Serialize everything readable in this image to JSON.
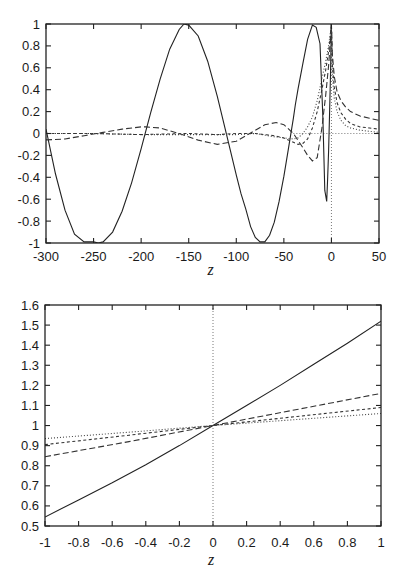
{
  "chart_data": [
    {
      "type": "line",
      "title": "",
      "xlabel": "z",
      "ylabel": "",
      "xlim": [
        -300,
        50
      ],
      "ylim": [
        -1,
        1
      ],
      "grid": false,
      "legend": "none",
      "x_ticks": [
        -300,
        -250,
        -200,
        -150,
        -100,
        -50,
        0,
        50
      ],
      "x_tick_labels": [
        "-300",
        "-250",
        "-200",
        "-150",
        "-100",
        "-50",
        "0",
        "50"
      ],
      "y_ticks": [
        -1,
        -0.8,
        -0.6,
        -0.4,
        -0.2,
        0,
        0.2,
        0.4,
        0.6,
        0.8,
        1
      ],
      "y_tick_labels": [
        "-1",
        "-0.8",
        "-0.6",
        "-0.4",
        "-0.2",
        "0",
        "0.2",
        "0.4",
        "0.6",
        "0.8",
        "1"
      ],
      "reference_lines": [
        {
          "orientation": "vertical",
          "at": 0,
          "style": "dotted"
        },
        {
          "orientation": "horizontal",
          "at": 0,
          "style": "dotted",
          "from": -40,
          "to": 50
        }
      ],
      "series": [
        {
          "name": "solid",
          "style": "solid",
          "x": [
            -300,
            -290,
            -280,
            -270,
            -260,
            -250,
            -245,
            -240,
            -230,
            -220,
            -210,
            -200,
            -190,
            -180,
            -170,
            -160,
            -155,
            -150,
            -140,
            -130,
            -120,
            -110,
            -100,
            -95,
            -90,
            -85,
            -80,
            -75,
            -70,
            -65,
            -60,
            -55,
            -50,
            -45,
            -40,
            -38,
            -35,
            -30,
            -25,
            -20,
            -16,
            -12,
            -9,
            -7,
            -5,
            -4,
            -3,
            -2,
            -1,
            0,
            0.5
          ],
          "y": [
            0.04,
            -0.37,
            -0.7,
            -0.92,
            -0.99,
            -0.99,
            -1.0,
            -0.99,
            -0.9,
            -0.71,
            -0.45,
            -0.14,
            0.19,
            0.5,
            0.77,
            0.95,
            1.0,
            0.99,
            0.89,
            0.66,
            0.34,
            -0.02,
            -0.38,
            -0.55,
            -0.69,
            -0.85,
            -0.95,
            -0.99,
            -0.99,
            -0.93,
            -0.81,
            -0.62,
            -0.39,
            -0.13,
            0.14,
            0.26,
            0.41,
            0.64,
            0.86,
            0.99,
            0.97,
            0.82,
            0.14,
            -0.52,
            -0.62,
            -0.42,
            -0.16,
            0.16,
            0.54,
            1.0,
            1.25
          ]
        },
        {
          "name": "long-dashed",
          "style": "long-dash",
          "x": [
            -300,
            -280,
            -260,
            -240,
            -220,
            -200,
            -195,
            -180,
            -160,
            -140,
            -120,
            -100,
            -80,
            -70,
            -58,
            -50,
            -40,
            -30,
            -25,
            -20,
            -15,
            -10,
            -6,
            -3,
            -1,
            0,
            1,
            3,
            6,
            10,
            15,
            20,
            30,
            40,
            50
          ],
          "y": [
            -0.058,
            -0.05,
            -0.02,
            0.01,
            0.04,
            0.06,
            0.06,
            0.05,
            0.0,
            -0.06,
            -0.1,
            -0.07,
            0.03,
            0.08,
            0.1,
            0.08,
            0.0,
            -0.13,
            -0.2,
            -0.25,
            -0.22,
            0.05,
            0.35,
            0.62,
            0.85,
            1.0,
            0.72,
            0.52,
            0.38,
            0.3,
            0.24,
            0.2,
            0.16,
            0.14,
            0.12
          ]
        },
        {
          "name": "short-dashed",
          "style": "short-dash",
          "x": [
            -300,
            -250,
            -200,
            -150,
            -120,
            -100,
            -80,
            -60,
            -50,
            -40,
            -35,
            -30,
            -25,
            -20,
            -15,
            -10,
            -6,
            -3,
            -1,
            0,
            1,
            3,
            6,
            10,
            15,
            20,
            30,
            40,
            50
          ],
          "y": [
            0.0,
            0.0,
            -0.01,
            0.0,
            -0.01,
            0.0,
            0.0,
            -0.02,
            -0.04,
            -0.08,
            -0.1,
            -0.09,
            -0.05,
            0.05,
            0.2,
            0.4,
            0.58,
            0.75,
            0.9,
            1.0,
            0.62,
            0.42,
            0.28,
            0.19,
            0.13,
            0.09,
            0.06,
            0.05,
            0.04
          ]
        },
        {
          "name": "dotted",
          "style": "dotted",
          "x": [
            -300,
            -250,
            -200,
            -150,
            -100,
            -80,
            -60,
            -50,
            -40,
            -35,
            -30,
            -25,
            -20,
            -15,
            -10,
            -6,
            -3,
            -1,
            0,
            1,
            3,
            6,
            10,
            15,
            20,
            30,
            40,
            50
          ],
          "y": [
            0.0,
            0.0,
            -0.01,
            -0.01,
            -0.01,
            0.0,
            -0.03,
            -0.04,
            -0.05,
            -0.04,
            0.0,
            0.06,
            0.15,
            0.3,
            0.5,
            0.66,
            0.8,
            0.93,
            1.0,
            0.52,
            0.32,
            0.2,
            0.12,
            0.07,
            0.05,
            0.03,
            0.02,
            0.01
          ]
        }
      ]
    },
    {
      "type": "line",
      "title": "",
      "xlabel": "z",
      "ylabel": "",
      "xlim": [
        -1,
        1
      ],
      "ylim": [
        0.5,
        1.6
      ],
      "grid": false,
      "legend": "none",
      "x_ticks": [
        -1,
        -0.8,
        -0.6,
        -0.4,
        -0.2,
        0,
        0.2,
        0.4,
        0.6,
        0.8,
        1
      ],
      "x_tick_labels": [
        "-1",
        "-0.8",
        "-0.6",
        "-0.4",
        "-0.2",
        "0",
        "0.2",
        "0.4",
        "0.6",
        "0.8",
        "1"
      ],
      "y_ticks": [
        0.5,
        0.6,
        0.7,
        0.8,
        0.9,
        1,
        1.1,
        1.2,
        1.3,
        1.4,
        1.5,
        1.6
      ],
      "y_tick_labels": [
        "0.5",
        "0.6",
        "0.7",
        "0.8",
        "0.9",
        "1",
        "1.1",
        "1.2",
        "1.3",
        "1.4",
        "1.5",
        "1.6"
      ],
      "reference_lines": [
        {
          "orientation": "vertical",
          "at": 0,
          "style": "dotted"
        }
      ],
      "series": [
        {
          "name": "solid",
          "style": "solid",
          "x": [
            -1,
            -0.8,
            -0.6,
            -0.4,
            -0.2,
            0,
            0.2,
            0.4,
            0.6,
            0.8,
            1
          ],
          "y": [
            0.545,
            0.63,
            0.715,
            0.805,
            0.9,
            1.0,
            1.1,
            1.2,
            1.305,
            1.41,
            1.52
          ]
        },
        {
          "name": "long-dashed",
          "style": "long-dash",
          "x": [
            -1,
            -0.5,
            0,
            0.5,
            1
          ],
          "y": [
            0.845,
            0.92,
            1.0,
            1.08,
            1.16
          ]
        },
        {
          "name": "short-dashed",
          "style": "short-dash",
          "x": [
            -1,
            -0.5,
            0,
            0.5,
            1
          ],
          "y": [
            0.905,
            0.952,
            1.0,
            1.045,
            1.09
          ]
        },
        {
          "name": "dotted",
          "style": "dotted",
          "x": [
            -1,
            -0.5,
            0,
            0.5,
            1
          ],
          "y": [
            0.935,
            0.967,
            1.0,
            1.03,
            1.06
          ]
        }
      ]
    }
  ],
  "layout": {
    "plots": [
      {
        "left": 46,
        "top": 24,
        "right": 379,
        "bottom": 243,
        "tick_label_y": 257,
        "xlabel_y": 275
      },
      {
        "left": 45,
        "top": 305,
        "right": 381,
        "bottom": 526,
        "tick_label_y": 543,
        "xlabel_y": 565
      }
    ]
  }
}
